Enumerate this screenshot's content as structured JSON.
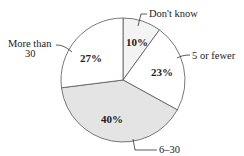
{
  "chart_data": {
    "type": "pie",
    "title": "",
    "start_angle_deg": 0,
    "direction": "clockwise",
    "slices": [
      {
        "label": "Don't know",
        "value": 10,
        "display": "10%",
        "color": "#f3f3f3"
      },
      {
        "label": "5 or fewer",
        "value": 23,
        "display": "23%",
        "color": "#ffffff"
      },
      {
        "label": "6–30",
        "value": 40,
        "display": "40%",
        "color": "#e4e4e4"
      },
      {
        "label": "More than 30",
        "value": 27,
        "display": "27%",
        "color": "#ffffff"
      }
    ],
    "label_lines": {
      "more_than_30_line1": "More than",
      "more_than_30_line2": "30"
    },
    "legend": "none (callout labels)",
    "stroke_color": "#555555"
  }
}
